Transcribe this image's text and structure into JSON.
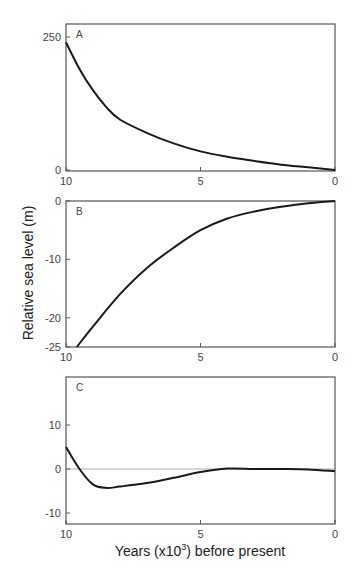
{
  "chart_data": [
    {
      "type": "line",
      "panel": "A",
      "title": "",
      "xlabel": "",
      "ylabel": "",
      "xlim": [
        10,
        0
      ],
      "ylim": [
        0,
        250
      ],
      "x_ticks": [
        "10",
        "5",
        "0"
      ],
      "y_ticks": [
        "250",
        "0"
      ],
      "grid": false,
      "series": [
        {
          "name": "A",
          "x": [
            10,
            9.5,
            9,
            8.5,
            8,
            7,
            6,
            5,
            4,
            3,
            2,
            1,
            0
          ],
          "values": [
            240,
            190,
            150,
            118,
            95,
            70,
            50,
            35,
            25,
            17,
            10,
            5,
            0
          ]
        }
      ]
    },
    {
      "type": "line",
      "panel": "B",
      "title": "",
      "xlabel": "",
      "ylabel": "Relative sea level (m)",
      "xlim": [
        10,
        0
      ],
      "ylim": [
        -25,
        0
      ],
      "x_ticks": [
        "10",
        "5",
        "0"
      ],
      "y_ticks": [
        "0",
        "-10",
        "-20",
        "-25"
      ],
      "grid": false,
      "series": [
        {
          "name": "B",
          "x": [
            9.6,
            9,
            8,
            7,
            6,
            5,
            4,
            3,
            2,
            1,
            0
          ],
          "values": [
            -25,
            -21.5,
            -16,
            -11.5,
            -8,
            -5,
            -3,
            -1.8,
            -1,
            -0.4,
            0
          ]
        }
      ]
    },
    {
      "type": "line",
      "panel": "C",
      "title": "",
      "xlabel": "Years (x10³) before present",
      "ylabel": "",
      "xlim": [
        10,
        0
      ],
      "ylim": [
        -12,
        20
      ],
      "x_ticks": [
        "10",
        "5",
        "0"
      ],
      "y_ticks": [
        "10",
        "0",
        "-10"
      ],
      "grid": false,
      "zero_line": true,
      "series": [
        {
          "name": "C",
          "x": [
            10,
            9.5,
            9,
            8.5,
            8,
            7,
            6,
            5,
            4,
            3,
            2,
            1,
            0
          ],
          "values": [
            5,
            0,
            -3.5,
            -4.3,
            -4,
            -3.2,
            -2,
            -0.7,
            0.1,
            0,
            0,
            -0.1,
            -0.5
          ]
        }
      ]
    }
  ],
  "labels": {
    "panel_a": "A",
    "panel_b": "B",
    "panel_c": "C",
    "y_axis_title": "Relative sea level (m)",
    "x_axis_title_prefix": "Years (x10",
    "x_axis_title_sup": "3",
    "x_axis_title_suffix": ") before present"
  },
  "colors": {
    "line": "#1a1a1a",
    "frame": "#555555",
    "zero_line": "#999999"
  }
}
